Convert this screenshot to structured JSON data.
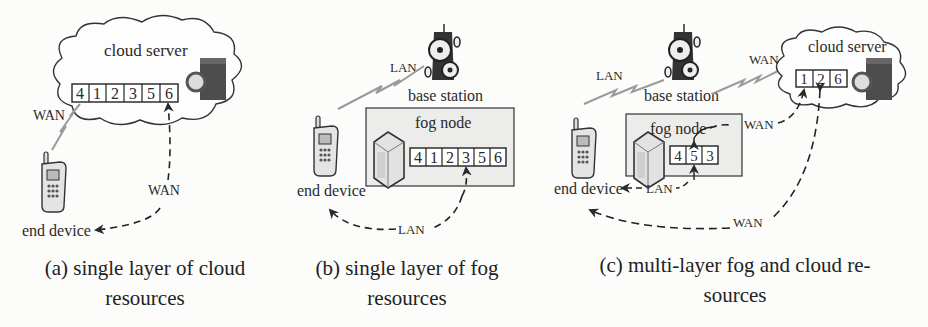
{
  "panels": [
    {
      "id": "a",
      "caption_line1": "(a) single layer of cloud",
      "caption_line2": "resources",
      "cloud_label": "cloud server",
      "queue": [
        "4",
        "1",
        "2",
        "3",
        "5",
        "6"
      ],
      "wireless_label": "WAN",
      "return_label": "WAN",
      "device_label": "end device"
    },
    {
      "id": "b",
      "caption_line1": "(b) single layer of fog",
      "caption_line2": "resources",
      "base_station_label": "base station",
      "wireless_label": "LAN",
      "fog_label": "fog node",
      "queue": [
        "4",
        "1",
        "2",
        "3",
        "5",
        "6"
      ],
      "return_label": "LAN",
      "device_label": "end device"
    },
    {
      "id": "c",
      "caption_line1": "(c) multi-layer fog and cloud re-",
      "caption_line2": "sources",
      "base_station_label": "base station",
      "wireless_lan_label": "LAN",
      "wireless_wan_label": "WAN",
      "cloud_label": "cloud server",
      "cloud_queue": [
        "1",
        "2",
        "6"
      ],
      "fog_label": "fog node",
      "fog_queue": [
        "4",
        "5",
        "3"
      ],
      "fog_to_cloud_label": "WAN",
      "fog_return_label": "LAN",
      "cloud_return_label": "WAN",
      "device_label": "end device"
    }
  ],
  "colors": {
    "background": "#fcfcfb",
    "stroke": "#2a2a2a",
    "fog_box_fill": "#ececea",
    "wireless": "#9a9a9a",
    "server_dark": "#4a4a4a"
  }
}
